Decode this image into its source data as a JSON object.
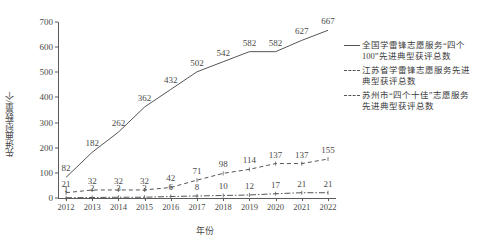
{
  "chart_data": {
    "type": "line",
    "title": "",
    "xlabel": "年份",
    "ylabel": "先进典型数量/个",
    "categories": [
      "2012",
      "2013",
      "2014",
      "2015",
      "2016",
      "2017",
      "2018",
      "2019",
      "2020",
      "2021",
      "2022"
    ],
    "ylim": [
      0,
      700
    ],
    "yticks": [
      0,
      100,
      200,
      300,
      400,
      500,
      600,
      700
    ],
    "grid": false,
    "legend_position": "right",
    "series": [
      {
        "name": "全国学雷锋志愿服务“四个100”先进典型获评总数",
        "style": "solid",
        "values": [
          82,
          182,
          262,
          362,
          432,
          502,
          542,
          582,
          582,
          627,
          667
        ]
      },
      {
        "name": "江苏省学雷锋志愿服务先进典型获评总数",
        "style": "dashed",
        "values": [
          21,
          32,
          32,
          32,
          42,
          71,
          98,
          114,
          137,
          137,
          155
        ]
      },
      {
        "name": "苏州市“四个十佳”志愿服务先进典型获评总数",
        "style": "dash-dot",
        "values": [
          1,
          2,
          3,
          3,
          6,
          8,
          10,
          12,
          17,
          21,
          21
        ]
      }
    ]
  },
  "axis": {
    "x_label": "年份",
    "y_label": "先进典型数量/个"
  },
  "legend": {
    "entries": [
      {
        "label": "全国学雷锋志愿服务“四个100”先进典型获评总数",
        "style": "solid"
      },
      {
        "label": "江苏省学雷锋志愿服务先进典型获评总数",
        "style": "dashed"
      },
      {
        "label": "苏州市“四个十佳”志愿服务先进典型获评总数",
        "style": "dash-dot"
      }
    ]
  },
  "colors": {
    "line": "#555555",
    "text": "#4a4a4a",
    "axis": "#5a5a5a",
    "background": "#ffffff"
  }
}
